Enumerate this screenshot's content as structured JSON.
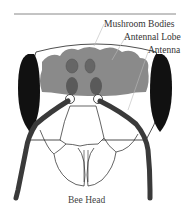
{
  "title": "Bee Head",
  "labels": {
    "mushroom_bodies": "Mushroom Bodies",
    "antennal_lobe": "Antennal Lobe",
    "antenna": "Antenna"
  },
  "colors": {
    "brain": "#8a8a8a",
    "eyes": "#111111",
    "antenna": "#3a3a3a",
    "outline": "#222222",
    "leader_lines": "#bbbbbb",
    "top_rule": "#888888"
  }
}
